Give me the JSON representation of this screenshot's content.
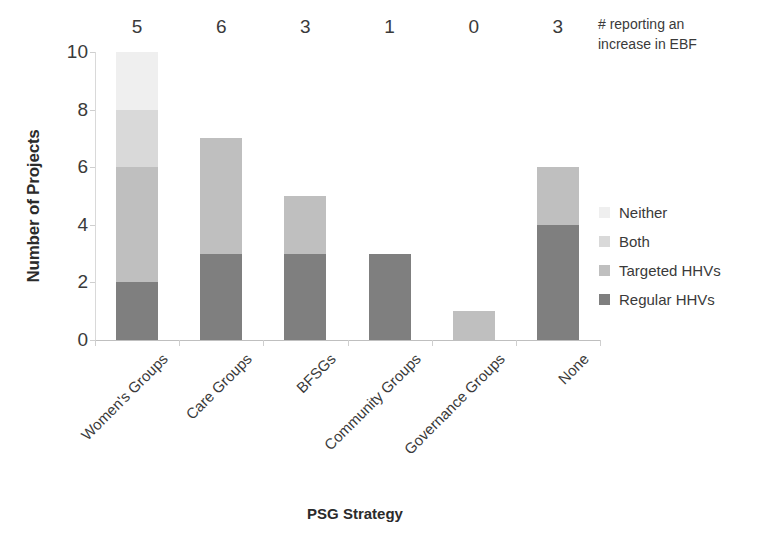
{
  "chart_data": {
    "type": "bar",
    "subtype": "stacked-bar",
    "title": "",
    "xlabel": "PSG Strategy",
    "ylabel": "Number of Projects",
    "ylim": [
      0,
      10
    ],
    "yticks": [
      0,
      2,
      4,
      6,
      8,
      10
    ],
    "grid": false,
    "legend_position": "right",
    "categories": [
      "Women's Groups",
      "Care Groups",
      "BFSGs",
      "Community Groups",
      "Governance Groups",
      "None"
    ],
    "series": [
      {
        "name": "Regular HHVs",
        "color": "#7f7f7f",
        "values": [
          2,
          3,
          3,
          3,
          0,
          4
        ]
      },
      {
        "name": "Targeted HHVs",
        "color": "#bfbfbf",
        "values": [
          4,
          4,
          2,
          0,
          1,
          2
        ]
      },
      {
        "name": "Both",
        "color": "#d9d9d9",
        "values": [
          2,
          0,
          0,
          0,
          0,
          0
        ]
      },
      {
        "name": "Neither",
        "color": "#efefef",
        "values": [
          2,
          0,
          0,
          0,
          0,
          0
        ]
      }
    ],
    "legend_order_top_to_bottom": [
      "Neither",
      "Both",
      "Targeted HHVs",
      "Regular HHVs"
    ],
    "totals": [
      10,
      7,
      5,
      3,
      1,
      6
    ],
    "data_labels": [
      "5",
      "6",
      "3",
      "1",
      "0",
      "3"
    ],
    "annotation": {
      "line1": "# reporting an",
      "line2": "increase in EBF"
    }
  }
}
